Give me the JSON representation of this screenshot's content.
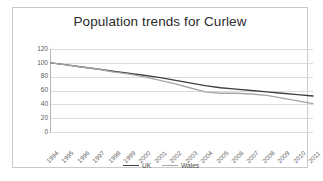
{
  "chart": {
    "title": "Population trends for Curlew"
  },
  "legend": {
    "position": "bottom-center",
    "entries": [
      {
        "label": "UK",
        "color": "#3f3f3f"
      },
      {
        "label": "Wales",
        "color": "#a6a6a6"
      }
    ]
  },
  "chart_data": {
    "type": "line",
    "title": "Population trends for Curlew",
    "xlabel": "",
    "ylabel": "",
    "grid": true,
    "ylim": [
      0,
      120
    ],
    "yticks": [
      0,
      20,
      40,
      60,
      80,
      100,
      120
    ],
    "categories": [
      "1994",
      "1995",
      "1996",
      "1997",
      "1998",
      "1999",
      "2000",
      "2001",
      "2002",
      "2003",
      "2004",
      "2005",
      "2006",
      "2007",
      "2008",
      "2009",
      "2010",
      "2011"
    ],
    "series": [
      {
        "name": "UK",
        "color": "#3f3f3f",
        "values": [
          100,
          97,
          94,
          91,
          88,
          85,
          82,
          79,
          75,
          71,
          67,
          64,
          62,
          60,
          58,
          56,
          54,
          52
        ]
      },
      {
        "name": "Wales",
        "color": "#a6a6a6",
        "values": [
          100,
          97,
          94,
          91,
          87,
          84,
          80,
          75,
          70,
          64,
          58,
          56,
          56,
          55,
          53,
          49,
          45,
          41
        ]
      }
    ]
  }
}
